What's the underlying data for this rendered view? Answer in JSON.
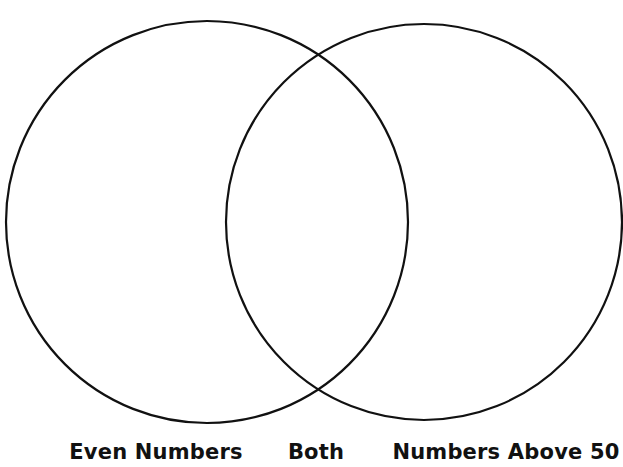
{
  "diagram": {
    "type": "venn",
    "stroke_color": "#111111",
    "background": "#ffffff",
    "circles": [
      {
        "id": "left",
        "cx": 207,
        "cy": 222,
        "r": 201
      },
      {
        "id": "right",
        "cx": 424,
        "cy": 222,
        "r": 198
      }
    ],
    "labels": {
      "left": "Even Numbers",
      "middle": "Both",
      "right": "Numbers Above 50"
    }
  }
}
